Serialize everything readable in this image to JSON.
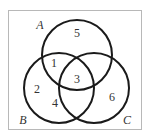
{
  "diagram": {
    "type": "venn",
    "colors": {
      "background": "#ffffff",
      "frame": "#b8b8b8",
      "circle_stroke": "#1a1a1a",
      "text": "#333333"
    },
    "sets": [
      {
        "name": "A",
        "label": "A"
      },
      {
        "name": "B",
        "label": "B"
      },
      {
        "name": "C",
        "label": "C"
      }
    ],
    "regions": {
      "A_only": "5",
      "A_and_B_only": "1",
      "A_and_B_and_C": "3",
      "B_only_upper": "2",
      "B_only_lower": "4",
      "C_only": "6"
    }
  }
}
